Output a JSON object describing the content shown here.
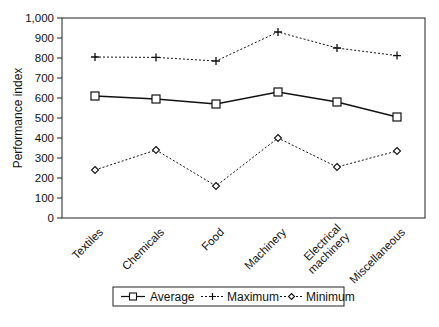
{
  "chart_data": {
    "type": "line",
    "title": "",
    "xlabel": "",
    "ylabel": "Performance index",
    "ylim": [
      0,
      1000
    ],
    "yticks": [
      "0",
      "100",
      "200",
      "300",
      "400",
      "500",
      "600",
      "700",
      "800",
      "900",
      "1,000"
    ],
    "grid": false,
    "legend_position": "bottom",
    "categories": [
      "Textiles",
      "Chemicals",
      "Food",
      "Machinery",
      "Electrical machinery",
      "Miscellaneous"
    ],
    "category_lines": [
      [
        "Textiles"
      ],
      [
        "Chemicals"
      ],
      [
        "Food"
      ],
      [
        "Machinery"
      ],
      [
        "Electrical",
        "machinery"
      ],
      [
        "Miscellaneous"
      ]
    ],
    "series": [
      {
        "name": "Average",
        "marker": "square",
        "line": "solid",
        "values": [
          610,
          595,
          570,
          630,
          580,
          505
        ]
      },
      {
        "name": "Maximum",
        "marker": "plus",
        "line": "dotted",
        "values": [
          805,
          803,
          785,
          930,
          850,
          812
        ]
      },
      {
        "name": "Minimum",
        "marker": "diamond",
        "line": "dotted",
        "values": [
          240,
          340,
          160,
          400,
          255,
          335
        ]
      }
    ]
  },
  "legend": {
    "items": [
      {
        "label": "Average"
      },
      {
        "label": "Maximum"
      },
      {
        "label": "Minimum"
      }
    ]
  }
}
